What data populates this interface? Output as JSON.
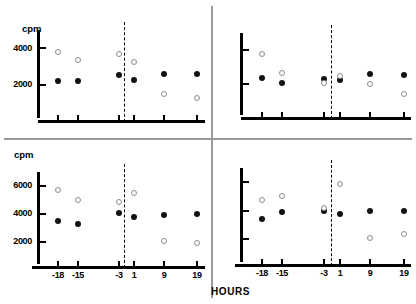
{
  "figure": {
    "global_xlabel": "HOURS",
    "y_axis_title": "cpm"
  },
  "chart_data": [
    {
      "panel": "top-left",
      "type": "scatter",
      "title": "",
      "xlabel": "",
      "ylabel": "cpm",
      "x": [
        -18,
        -15,
        -3,
        1,
        9,
        19
      ],
      "xtick_labels": [
        "-18",
        "-15",
        "-3",
        "1",
        "9",
        "19"
      ],
      "ytick_labels": [
        "4000",
        "2000"
      ],
      "yticks": [
        4000,
        2000
      ],
      "ylim": [
        500,
        5000
      ],
      "grid": false,
      "reference_line_x": 0,
      "reference_line_style": "dashed",
      "series": [
        {
          "name": "filled-circle",
          "marker": "filled",
          "values": [
            2200,
            2220,
            2550,
            2280,
            2560,
            2580
          ]
        },
        {
          "name": "open-circle",
          "marker": "open",
          "values": [
            3800,
            3350,
            3700,
            3250,
            1500,
            1280
          ]
        }
      ]
    },
    {
      "panel": "top-right",
      "type": "scatter",
      "title": "",
      "xlabel": "",
      "ylabel": "",
      "x": [
        -18,
        -15,
        -3,
        1,
        9,
        19
      ],
      "xtick_labels": [
        "-18",
        "-15",
        "-3",
        "1",
        "9",
        "19"
      ],
      "ytick_labels": [],
      "yticks": [
        4000,
        2000
      ],
      "ylim": [
        500,
        5000
      ],
      "grid": false,
      "reference_line_x": 0,
      "reference_line_style": "dashed",
      "series": [
        {
          "name": "filled-circle",
          "marker": "filled",
          "values": [
            2350,
            2050,
            2300,
            2240,
            2620,
            2560
          ]
        },
        {
          "name": "open-circle",
          "marker": "open",
          "values": [
            3780,
            2650,
            2080,
            2500,
            2020,
            1450
          ]
        }
      ]
    },
    {
      "panel": "bottom-left",
      "type": "scatter",
      "title": "",
      "xlabel": "HOURS",
      "ylabel": "cpm",
      "x": [
        -18,
        -15,
        -3,
        1,
        9,
        19
      ],
      "xtick_labels": [
        "-18",
        "-15",
        "-3",
        "1",
        "9",
        "19"
      ],
      "ytick_labels": [
        "6000",
        "4000",
        "2000"
      ],
      "yticks": [
        6000,
        4000,
        2000
      ],
      "ylim": [
        700,
        7000
      ],
      "grid": false,
      "reference_line_x": 0,
      "reference_line_style": "dashed",
      "series": [
        {
          "name": "filled-circle",
          "marker": "filled",
          "values": [
            3520,
            3270,
            4050,
            3800,
            3950,
            4000
          ]
        },
        {
          "name": "open-circle",
          "marker": "open",
          "values": [
            5700,
            5000,
            4870,
            5520,
            2070,
            1900
          ]
        }
      ]
    },
    {
      "panel": "bottom-right",
      "type": "scatter",
      "title": "",
      "xlabel": "HOURS",
      "ylabel": "",
      "x": [
        -18,
        -15,
        -3,
        1,
        9,
        19
      ],
      "xtick_labels": [
        "-18",
        "-15",
        "-3",
        "1",
        "9",
        "19"
      ],
      "ytick_labels": [],
      "yticks": [
        6000,
        4000,
        2000
      ],
      "ylim": [
        700,
        7000
      ],
      "grid": false,
      "reference_line_x": 0,
      "reference_line_style": "dashed",
      "series": [
        {
          "name": "filled-circle",
          "marker": "filled",
          "values": [
            3450,
            3950,
            4020,
            3800,
            4000,
            4000
          ]
        },
        {
          "name": "open-circle",
          "marker": "open",
          "values": [
            4750,
            5050,
            4200,
            5900,
            2100,
            2350
          ]
        }
      ]
    }
  ]
}
